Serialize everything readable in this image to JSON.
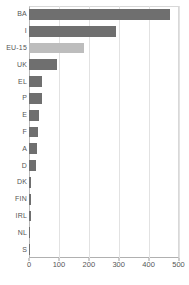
{
  "chart_data": {
    "type": "bar",
    "orientation": "horizontal",
    "title": "",
    "xlabel": "",
    "ylabel": "",
    "xlim": [
      0,
      500
    ],
    "ylim": null,
    "grid": true,
    "legend": false,
    "xticks": [
      0,
      100,
      200,
      300,
      400,
      500
    ],
    "xtick_labels": [
      "0",
      "100",
      "200",
      "300",
      "400",
      "500"
    ],
    "categories": [
      "BA",
      "I",
      "EU-15",
      "UK",
      "EL",
      "P",
      "E",
      "F",
      "A",
      "D",
      "DK",
      "FIN",
      "IRL",
      "NL",
      "S"
    ],
    "values": [
      470,
      290,
      185,
      95,
      45,
      42,
      32,
      30,
      26,
      22,
      8,
      7,
      7,
      5,
      4
    ],
    "bar_colors": [
      "#6f6f6f",
      "#6f6f6f",
      "#bdbdbd",
      "#6f6f6f",
      "#6f6f6f",
      "#6f6f6f",
      "#6f6f6f",
      "#6f6f6f",
      "#6f6f6f",
      "#6f6f6f",
      "#6f6f6f",
      "#6f6f6f",
      "#6f6f6f",
      "#6f6f6f",
      "#6f6f6f"
    ],
    "highlight_category": "EU-15",
    "series": [
      {
        "name": "value",
        "values": [
          470,
          290,
          185,
          95,
          45,
          42,
          32,
          30,
          26,
          22,
          8,
          7,
          7,
          5,
          4
        ]
      }
    ],
    "colors": {
      "bar": "#6f6f6f",
      "bar_highlight": "#bdbdbd",
      "grid": "#e2e2e2",
      "axis": "#b0b0b0",
      "text": "#555555",
      "background": "#ffffff"
    }
  },
  "axis": {
    "x_tick_0": "0",
    "x_tick_1": "100",
    "x_tick_2": "200",
    "x_tick_3": "300",
    "x_tick_4": "400",
    "x_tick_5": "500"
  },
  "labels": {
    "c0": "BA",
    "c1": "I",
    "c2": "EU-15",
    "c3": "UK",
    "c4": "EL",
    "c5": "P",
    "c6": "E",
    "c7": "F",
    "c8": "A",
    "c9": "D",
    "c10": "DK",
    "c11": "FIN",
    "c12": "IRL",
    "c13": "NL",
    "c14": "S"
  }
}
